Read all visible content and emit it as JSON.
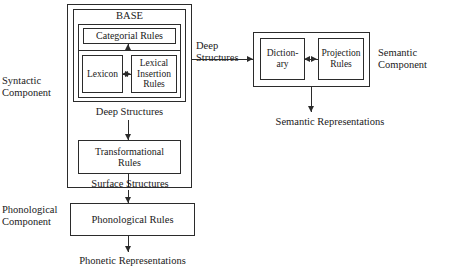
{
  "diagram": {
    "background_color": "#ffffff",
    "line_color": "#2b2b2b",
    "text_color": "#1a1a1a"
  },
  "syntactic": {
    "component_label": "Syntactic\nComponent",
    "base_label": "BASE",
    "categorial_rules": "Categorial Rules",
    "lexicon": "Lexicon",
    "lexical_insertion_rules": "Lexical\nInsertion\nRules",
    "deep_structures_label": "Deep Structures",
    "transformational_rules": "Transformational\nRules",
    "surface_structures_label": "Surface Structures"
  },
  "semantic": {
    "component_label": "Semantic\nComponent",
    "deep_structures_input_label": "Deep\nStructures",
    "dictionary": "Diction-\nary",
    "projection_rules": "Projection\nRules",
    "representations_label": "Semantic Representations"
  },
  "phonological": {
    "component_label": "Phonological\nComponent",
    "phonological_rules": "Phonological Rules",
    "representations_label": "Phonetic Representations"
  }
}
